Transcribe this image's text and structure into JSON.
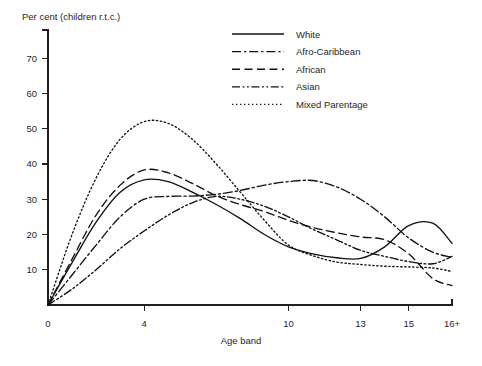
{
  "chart_data": {
    "type": "line",
    "title": "",
    "ylabel": "Per cent (children r.t.c.)",
    "xlabel": "Age band",
    "grid": false,
    "legend_position": "top-right",
    "x_tick_labels": [
      "0",
      "4",
      "10",
      "13",
      "15",
      "16+"
    ],
    "x_tick_values": [
      0,
      4,
      10,
      13,
      15,
      16.8
    ],
    "xlim": [
      0,
      16.8
    ],
    "y_tick_labels": [
      "10",
      "20",
      "30",
      "40",
      "50",
      "60",
      "70"
    ],
    "y_tick_values": [
      10,
      20,
      30,
      40,
      50,
      60,
      70
    ],
    "ylim": [
      0,
      78
    ],
    "x": [
      0,
      1,
      2,
      3,
      4,
      5,
      6,
      7,
      8,
      9,
      10,
      11,
      12,
      13,
      14,
      15,
      16,
      16.8
    ],
    "series": [
      {
        "name": "White",
        "style": "solid",
        "values": [
          0,
          12,
          23.5,
          32,
          35.5,
          35,
          32,
          28.5,
          24.5,
          20,
          16.5,
          14.5,
          13.4,
          13.2,
          16.5,
          22.5,
          23.2,
          17.5
        ]
      },
      {
        "name": "Afro-Caribbean",
        "style": "dash-dot",
        "values": [
          0,
          8.5,
          17,
          25,
          30,
          30.8,
          30.9,
          31.4,
          32.5,
          34,
          35,
          35.3,
          33.5,
          30,
          25,
          19,
          15,
          13.5
        ]
      },
      {
        "name": "African",
        "style": "dashed",
        "values": [
          0,
          13,
          25.5,
          34,
          38.3,
          37.5,
          34.5,
          31,
          28.5,
          26.5,
          24,
          22,
          20.5,
          19.3,
          18.5,
          14.5,
          7.5,
          5.5
        ]
      },
      {
        "name": "Asian",
        "style": "dash-dot-dot",
        "values": [
          0,
          4.5,
          10,
          16,
          21,
          25.5,
          29,
          30.8,
          30,
          28,
          25,
          21.5,
          18.5,
          15.5,
          13.8,
          12.3,
          11.7,
          13.8
        ]
      },
      {
        "name": "Mixed Parentage",
        "style": "dotted",
        "values": [
          0,
          20,
          36,
          47,
          52,
          51.5,
          47,
          40,
          32,
          24,
          17,
          14,
          12.2,
          11.5,
          11,
          10.8,
          10.5,
          9.5
        ]
      }
    ]
  },
  "legend": {
    "entries": [
      {
        "label": "White"
      },
      {
        "label": "Afro-Caribbean"
      },
      {
        "label": "African"
      },
      {
        "label": "Asian"
      },
      {
        "label": "Mixed Parentage"
      }
    ]
  },
  "colors": {
    "ink": "#111111",
    "axis": "#1f1f1f",
    "background": "#ffffff"
  }
}
